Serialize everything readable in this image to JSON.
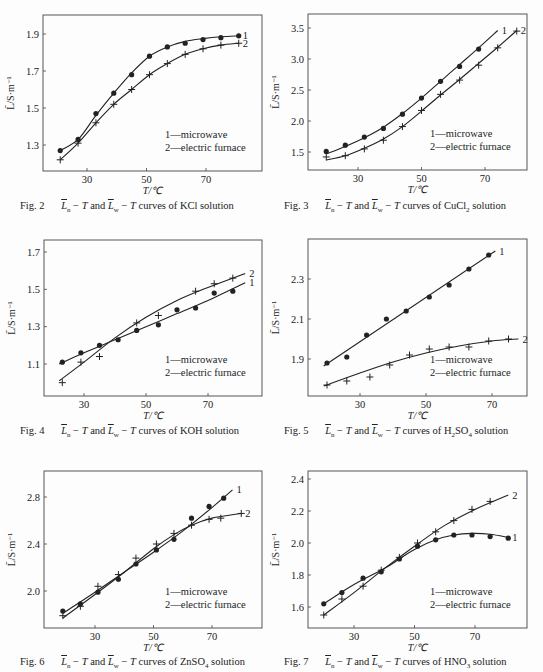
{
  "chart_data": [
    {
      "id": "fig2",
      "type": "line",
      "caption": {
        "fig": "Fig. 2",
        "solution": "KCl",
        "subscript_parts": []
      },
      "caption_text": "Fig. 2  L̄n − T and L̄w − T curves of KCl solution",
      "xlabel": "T/℃",
      "ylabel": "L̄/S·m⁻¹",
      "xticks": [
        30,
        50,
        70
      ],
      "yticks": [
        1.3,
        1.5,
        1.7,
        1.9
      ],
      "ytick_labels": [
        "1.3",
        "1.5",
        "1.7",
        "1.9"
      ],
      "xlim": [
        16,
        87
      ],
      "ylim": [
        1.16,
        2.0
      ],
      "grid": false,
      "legend": [
        "1—microwave",
        "2—electric furnace"
      ],
      "legend_position": "lower-right",
      "series": [
        {
          "name": "microwave",
          "label": "1",
          "marker": "dot",
          "x": [
            21,
            27,
            33,
            39,
            45,
            51,
            57,
            63,
            69,
            75,
            81
          ],
          "y": [
            1.27,
            1.33,
            1.47,
            1.58,
            1.68,
            1.78,
            1.83,
            1.85,
            1.87,
            1.88,
            1.89
          ],
          "curve_x": [
            21,
            27,
            33,
            39,
            45,
            51,
            57,
            63,
            69,
            75,
            81
          ],
          "curve_y": [
            1.27,
            1.33,
            1.46,
            1.58,
            1.69,
            1.78,
            1.83,
            1.86,
            1.875,
            1.885,
            1.89
          ]
        },
        {
          "name": "electric furnace",
          "label": "2",
          "marker": "plus",
          "x": [
            21,
            27,
            33,
            39,
            45,
            51,
            57,
            63,
            69,
            75,
            81
          ],
          "y": [
            1.22,
            1.31,
            1.42,
            1.52,
            1.6,
            1.68,
            1.74,
            1.79,
            1.82,
            1.84,
            1.85
          ]
        }
      ]
    },
    {
      "id": "fig3",
      "type": "line",
      "caption_text": "Fig. 3  L̄n − T and L̄w − T curves of CuCl2 solution",
      "xlabel": "T/℃",
      "ylabel": "L̄/S·m⁻¹",
      "xticks": [
        30,
        50,
        70
      ],
      "yticks": [
        1.5,
        2.0,
        2.5,
        3.0,
        3.5
      ],
      "ytick_labels": [
        "1.5",
        "2.0",
        "2.5",
        "3.0",
        "3.5"
      ],
      "xlim": [
        14,
        83
      ],
      "ylim": [
        1.22,
        3.72
      ],
      "grid": false,
      "legend": [
        "1—microwave",
        "2—electric furnace"
      ],
      "legend_position": "lower-right",
      "series": [
        {
          "name": "microwave",
          "label": "1",
          "marker": "dot",
          "x": [
            20,
            26,
            32,
            38,
            44,
            50,
            56,
            62,
            68
          ],
          "y": [
            1.51,
            1.61,
            1.74,
            1.88,
            2.11,
            2.37,
            2.64,
            2.88,
            3.16
          ],
          "curve_x": [
            20,
            26,
            32,
            38,
            44,
            50,
            56,
            62,
            68,
            74
          ],
          "curve_y": [
            1.47,
            1.59,
            1.73,
            1.9,
            2.12,
            2.37,
            2.64,
            2.91,
            3.18,
            3.46
          ]
        },
        {
          "name": "electric furnace",
          "label": "2",
          "marker": "plus",
          "x": [
            20,
            26,
            32,
            38,
            44,
            50,
            56,
            62,
            68,
            74,
            80
          ],
          "y": [
            1.42,
            1.44,
            1.55,
            1.69,
            1.91,
            2.17,
            2.43,
            2.66,
            2.9,
            3.18,
            3.45
          ],
          "curve_x": [
            20,
            26,
            32,
            38,
            44,
            50,
            56,
            62,
            68,
            74,
            80
          ],
          "curve_y": [
            1.37,
            1.44,
            1.56,
            1.71,
            1.91,
            2.16,
            2.42,
            2.67,
            2.93,
            3.19,
            3.46
          ]
        }
      ]
    },
    {
      "id": "fig4",
      "type": "line",
      "caption_text": "Fig. 4  L̄n − T and L̄w − T curves of KOH solution",
      "xlabel": "T/℃",
      "ylabel": "L̄/S·m⁻¹",
      "xticks": [
        30,
        50,
        70
      ],
      "yticks": [
        1.1,
        1.3,
        1.5,
        1.7
      ],
      "ytick_labels": [
        "1.1",
        "1.3",
        "1.5",
        "1.7"
      ],
      "xlim": [
        17,
        87
      ],
      "ylim": [
        0.93,
        1.76
      ],
      "grid": false,
      "legend": [
        "1—microwave",
        "2—electric furnace"
      ],
      "legend_position": "lower-right",
      "series": [
        {
          "name": "microwave",
          "label": "1",
          "marker": "dot",
          "x": [
            23,
            29,
            35,
            41,
            47,
            54,
            60,
            66,
            72,
            78
          ],
          "y": [
            1.11,
            1.16,
            1.2,
            1.23,
            1.28,
            1.31,
            1.39,
            1.4,
            1.48,
            1.49
          ],
          "curve_x": [
            22,
            30,
            40,
            50,
            60,
            70,
            82
          ],
          "curve_y": [
            1.1,
            1.16,
            1.23,
            1.3,
            1.37,
            1.44,
            1.535
          ]
        },
        {
          "name": "electric furnace",
          "label": "2",
          "marker": "plus",
          "x": [
            23,
            29,
            35,
            47,
            54,
            66,
            72,
            78
          ],
          "y": [
            1.0,
            1.11,
            1.14,
            1.32,
            1.36,
            1.49,
            1.53,
            1.56
          ],
          "curve_x": [
            22,
            30,
            40,
            50,
            60,
            70,
            82
          ],
          "curve_y": [
            1.01,
            1.11,
            1.24,
            1.35,
            1.44,
            1.51,
            1.585
          ]
        }
      ]
    },
    {
      "id": "fig5",
      "type": "line",
      "caption_text": "Fig. 5  L̄n − T and L̄w − T curves of H2SO4 solution",
      "xlabel": "T/℃",
      "ylabel": "L̄/S·m⁻¹",
      "xticks": [
        30,
        50,
        70
      ],
      "yticks": [
        1.9,
        2.1,
        2.3
      ],
      "ytick_labels": [
        "1.9",
        "2.1",
        "2.3"
      ],
      "xlim": [
        14,
        81
      ],
      "ylim": [
        1.72,
        2.44
      ],
      "grid": false,
      "legend": [
        "1—microwave",
        "2—electric furnace"
      ],
      "legend_position": "lower-right",
      "series": [
        {
          "name": "microwave",
          "label": "1",
          "marker": "dot",
          "x": [
            20,
            26,
            32,
            38,
            44,
            51,
            57,
            63,
            69
          ],
          "y": [
            1.88,
            1.91,
            2.02,
            2.1,
            2.14,
            2.21,
            2.27,
            2.35,
            2.42
          ],
          "curve_x": [
            19,
            71
          ],
          "curve_y": [
            1.865,
            2.44
          ]
        },
        {
          "name": "electric furnace",
          "label": "2",
          "marker": "plus",
          "x": [
            20,
            26,
            33,
            39,
            45,
            51,
            57,
            63,
            69,
            75
          ],
          "y": [
            1.77,
            1.79,
            1.81,
            1.87,
            1.92,
            1.95,
            1.96,
            1.96,
            1.99,
            2.0
          ],
          "curve_x": [
            19,
            30,
            40,
            50,
            60,
            70,
            78
          ],
          "curve_y": [
            1.765,
            1.83,
            1.885,
            1.93,
            1.965,
            1.99,
            2.0
          ]
        }
      ]
    },
    {
      "id": "fig6",
      "type": "line",
      "caption_text": "Fig. 6  L̄n − T and L̄w − T curves of ZnSO4 solution",
      "xlabel": "T/℃",
      "ylabel": "L̄/S·m⁻¹",
      "xticks": [
        30,
        50,
        70
      ],
      "yticks": [
        2.0,
        2.4,
        2.8
      ],
      "ytick_labels": [
        "2.0",
        "2.4",
        "2.8"
      ],
      "xlim": [
        14,
        87
      ],
      "ylim": [
        1.68,
        3.02
      ],
      "grid": false,
      "legend": [
        "1—microwave",
        "2—electric furnace"
      ],
      "legend_position": "lower-right",
      "series": [
        {
          "name": "microwave",
          "label": "1",
          "marker": "dot",
          "x": [
            19,
            25,
            31,
            38,
            44,
            51,
            57,
            63,
            69,
            74
          ],
          "y": [
            1.83,
            1.89,
            1.99,
            2.1,
            2.23,
            2.35,
            2.44,
            2.62,
            2.72,
            2.79
          ],
          "curve_x": [
            19,
            30,
            40,
            50,
            60,
            70,
            77
          ],
          "curve_y": [
            1.81,
            1.99,
            2.16,
            2.33,
            2.51,
            2.71,
            2.86
          ]
        },
        {
          "name": "electric furnace",
          "label": "2",
          "marker": "plus",
          "x": [
            19,
            25,
            31,
            38,
            44,
            51,
            57,
            63,
            69,
            73,
            80
          ],
          "y": [
            1.79,
            1.87,
            2.04,
            2.14,
            2.28,
            2.4,
            2.49,
            2.56,
            2.61,
            2.62,
            2.66
          ],
          "curve_x": [
            19,
            30,
            40,
            50,
            57,
            63,
            70,
            80
          ],
          "curve_y": [
            1.77,
            1.97,
            2.16,
            2.36,
            2.48,
            2.56,
            2.62,
            2.66
          ]
        }
      ]
    },
    {
      "id": "fig7",
      "type": "line",
      "caption_text": "Fig. 7  L̄n − T and L̄w − T curves of HNO3 solution",
      "xlabel": "T/℃",
      "ylabel": "L̄/S·m⁻¹",
      "xticks": [
        30,
        50,
        70
      ],
      "yticks": [
        1.6,
        1.8,
        2.0,
        2.2,
        2.4
      ],
      "ytick_labels": [
        "1.6",
        "1.8",
        "2.0",
        "2.2",
        "2.4"
      ],
      "xlim": [
        15,
        87
      ],
      "ylim": [
        1.47,
        2.44
      ],
      "grid": false,
      "legend": [
        "1—microwave",
        "2—electric furnace"
      ],
      "legend_position": "lower-right",
      "series": [
        {
          "name": "microwave",
          "label": "1",
          "marker": "dot",
          "x": [
            20,
            26,
            33,
            39,
            45,
            51,
            57,
            63,
            69,
            75,
            81
          ],
          "y": [
            1.62,
            1.69,
            1.78,
            1.82,
            1.9,
            1.98,
            2.02,
            2.05,
            2.05,
            2.04,
            2.03
          ],
          "curve_x": [
            20,
            30,
            40,
            45,
            50,
            57,
            63,
            69,
            75,
            81
          ],
          "curve_y": [
            1.62,
            1.74,
            1.84,
            1.9,
            1.96,
            2.02,
            2.05,
            2.06,
            2.055,
            2.035
          ]
        },
        {
          "name": "electric furnace",
          "label": "2",
          "marker": "plus",
          "x": [
            20,
            26,
            33,
            39,
            45,
            51,
            57,
            63,
            69,
            75
          ],
          "y": [
            1.55,
            1.65,
            1.73,
            1.83,
            1.91,
            2.0,
            2.07,
            2.14,
            2.21,
            2.26
          ],
          "curve_x": [
            20,
            30,
            40,
            50,
            60,
            70,
            81
          ],
          "curve_y": [
            1.55,
            1.69,
            1.84,
            1.98,
            2.11,
            2.21,
            2.3
          ]
        }
      ]
    }
  ],
  "panels": [
    {
      "fig": "Fig. 2",
      "solution": "KCl solution",
      "sub": ""
    },
    {
      "fig": "Fig. 3",
      "solution": "CuCl",
      "sub": "2",
      "tail": " solution"
    },
    {
      "fig": "Fig. 4",
      "solution": "KOH solution",
      "sub": ""
    },
    {
      "fig": "Fig. 5",
      "solution": "H",
      "sub": "2",
      "mid": "SO",
      "sub2": "4",
      "tail": " solution"
    },
    {
      "fig": "Fig. 6",
      "solution": "ZnSO",
      "sub": "4",
      "tail": " solution"
    },
    {
      "fig": "Fig. 7",
      "solution": "HNO",
      "sub": "3",
      "tail": " solution"
    }
  ],
  "caption_common": {
    "L": "L",
    "sub_n": "n",
    "sub_w": "w",
    "dash": " − ",
    "T": "T",
    "and": " and ",
    "curves_of": " curves of "
  }
}
